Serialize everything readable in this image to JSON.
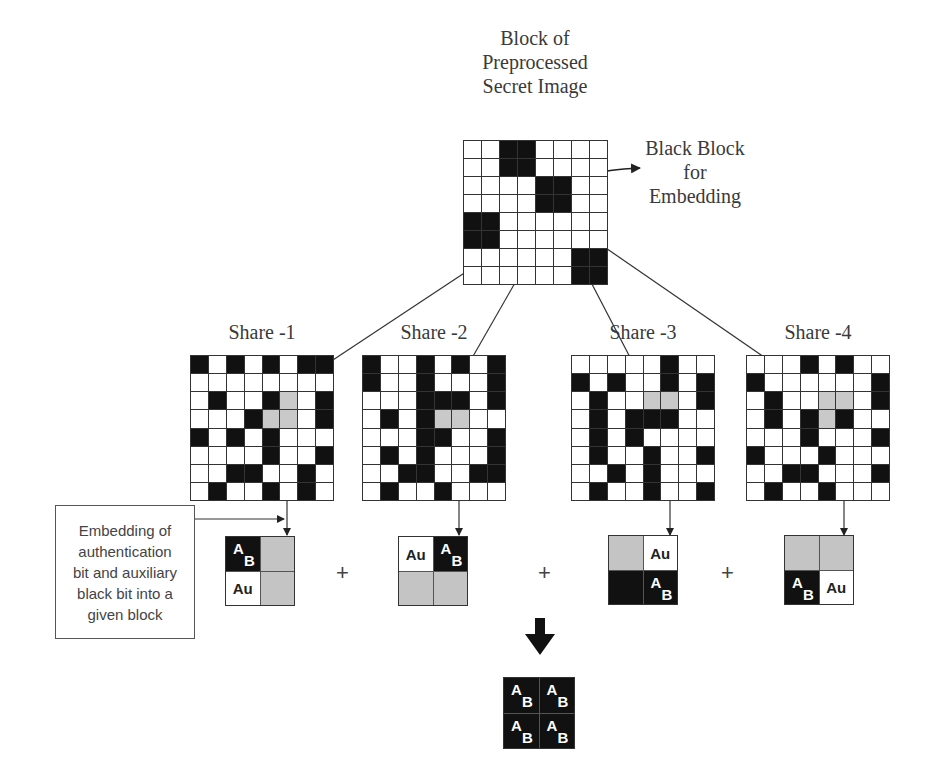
{
  "title": {
    "lines": [
      "Block of",
      "Preprocessed",
      "Secret Image"
    ]
  },
  "black_block_label": {
    "lines": [
      "Black Block",
      "for",
      "Embedding"
    ]
  },
  "secret_block": {
    "rows": [
      "WWBBWWWW",
      "WWBBWWWW",
      "WWWWBBWW",
      "WWWWBBWW",
      "BBWWWWWW",
      "BBWWWWWW",
      "WWWWWWBB",
      "WWWWWWBB"
    ]
  },
  "shares": [
    {
      "label": "Share -1",
      "rows": [
        "BWBWBWBB",
        "WWWWWWWW",
        "WBWWBGWB",
        "WWWBGGWB",
        "BWBWBWWW",
        "WWWWBWWB",
        "WWBBWWBW",
        "WBWWBWBW"
      ],
      "embedded": [
        {
          "color": "B",
          "text": "AB"
        },
        {
          "color": "G",
          "text": ""
        },
        {
          "color": "W",
          "text": "Au"
        },
        {
          "color": "G",
          "text": ""
        }
      ]
    },
    {
      "label": "Share -2",
      "rows": [
        "BWWBWBWB",
        "BWWBWWWB",
        "WWWBBBWB",
        "WBWBGGWW",
        "WWWBBWWB",
        "WBWBWWWB",
        "WWBBWWBB",
        "WBWWBWWW"
      ],
      "embedded": [
        {
          "color": "W",
          "text": "Au"
        },
        {
          "color": "B",
          "text": "AB"
        },
        {
          "color": "G",
          "text": ""
        },
        {
          "color": "G",
          "text": ""
        }
      ]
    },
    {
      "label": "Share -3",
      "rows": [
        "WWWWWBWW",
        "BWBWWBWB",
        "WBWWGGWB",
        "WBWBBBWW",
        "WBWBWWWW",
        "WBWWBWWB",
        "WWBWBWWW",
        "WBWWBWWB"
      ],
      "embedded": [
        {
          "color": "G",
          "text": ""
        },
        {
          "color": "W",
          "text": "Au"
        },
        {
          "color": "B",
          "text": ""
        },
        {
          "color": "B",
          "text": "AB"
        }
      ]
    },
    {
      "label": "Share -4",
      "rows": [
        "WWWBWBWW",
        "BWWWWWWB",
        "WBWWGGWB",
        "WBWBGBWW",
        "WWWBWWWB",
        "BWWWBWWW",
        "WWBBWWWB",
        "WBWWBWWW"
      ],
      "embedded": [
        {
          "color": "G",
          "text": ""
        },
        {
          "color": "G",
          "text": ""
        },
        {
          "color": "B",
          "text": "AB"
        },
        {
          "color": "W",
          "text": "Au"
        }
      ]
    }
  ],
  "operators": [
    "+",
    "+",
    "+"
  ],
  "annotation": {
    "lines": [
      "Embedding of",
      "authentication",
      "bit and auxiliary",
      "black bit into a",
      "given block"
    ]
  },
  "result": {
    "cells": [
      {
        "color": "B",
        "text": "AB"
      },
      {
        "color": "B",
        "text": "AB"
      },
      {
        "color": "B",
        "text": "AB"
      },
      {
        "color": "B",
        "text": "AB"
      }
    ]
  },
  "glyphs": {
    "a": "A",
    "b": "B",
    "au": "Au"
  }
}
